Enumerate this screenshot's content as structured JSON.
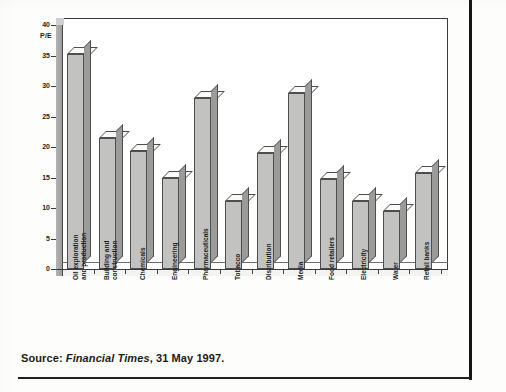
{
  "chart_data": {
    "type": "bar",
    "title": "",
    "subtitle": "",
    "xlabel": "",
    "ylabel": "P/E",
    "ylim": [
      0,
      40
    ],
    "yticks": [
      0,
      5,
      10,
      15,
      20,
      25,
      30,
      35,
      40
    ],
    "ytick_labels": [
      "0",
      "5",
      "10",
      "15",
      "20",
      "25",
      "30",
      "35",
      "40"
    ],
    "grid": false,
    "legend": false,
    "legend_position": "none",
    "style": "3d-column",
    "categories": [
      "Oil exploration and production",
      "Building and construction",
      "Chemicals",
      "Engineering",
      "Pharmaceuticals",
      "Tobacco",
      "Distribution",
      "Media",
      "Food retailers",
      "Electricity",
      "Water",
      "Retail banks"
    ],
    "category_lines": [
      [
        "Oil exploration",
        "and production"
      ],
      [
        "Building and",
        "construction"
      ],
      [
        "Chemicals"
      ],
      [
        "Engineering"
      ],
      [
        "Pharmaceuticals"
      ],
      [
        "Tobacco"
      ],
      [
        "Distribution"
      ],
      [
        "Media"
      ],
      [
        "Food retailers"
      ],
      [
        "Electricity"
      ],
      [
        "Water"
      ],
      [
        "Retail banks"
      ]
    ],
    "values": [
      35.2,
      21.4,
      19.3,
      15.0,
      28.0,
      11.2,
      19.0,
      28.8,
      14.7,
      11.1,
      9.5,
      15.8
    ]
  },
  "colors": {
    "bar_front": "#c2c2c0",
    "bar_side": "#9b9b99",
    "bar_top": "#fafafa",
    "outline": "#4e4e4e",
    "axis": "#3b3b3b",
    "text": "#1c1c1c",
    "page_rule": "#161616",
    "background": "#fdfdfc"
  },
  "caption": {
    "prefix": "Source:",
    "publication": "Financial Times",
    "suffix": ", 31 May 1997."
  }
}
